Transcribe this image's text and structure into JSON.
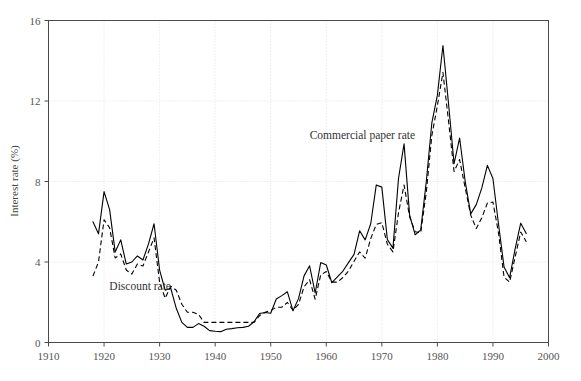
{
  "chart_data": {
    "type": "line",
    "title": "",
    "xlabel": "",
    "ylabel": "Interest rate (%)",
    "xlim": [
      1910,
      2000
    ],
    "ylim": [
      0,
      16
    ],
    "xticks": [
      1910,
      1920,
      1930,
      1940,
      1950,
      1960,
      1970,
      1980,
      1990,
      2000
    ],
    "yticks": [
      0,
      4,
      8,
      12,
      16
    ],
    "grid": true,
    "legend_position": "inline-annotations",
    "annotations": [
      {
        "text": "Commercial paper rate",
        "x": 1966.5,
        "y": 10.1,
        "anchor": "middle"
      },
      {
        "text": "Discount rate",
        "x": 1926.5,
        "y": 2.6,
        "anchor": "middle"
      }
    ],
    "series": [
      {
        "name": "Commercial paper rate",
        "style": "solid",
        "x": [
          1918,
          1919,
          1920,
          1921,
          1922,
          1923,
          1924,
          1925,
          1926,
          1927,
          1928,
          1929,
          1930,
          1931,
          1932,
          1933,
          1934,
          1935,
          1936,
          1937,
          1938,
          1939,
          1940,
          1941,
          1942,
          1943,
          1944,
          1945,
          1946,
          1947,
          1948,
          1949,
          1950,
          1951,
          1952,
          1953,
          1954,
          1955,
          1956,
          1957,
          1958,
          1959,
          1960,
          1961,
          1962,
          1963,
          1964,
          1965,
          1966,
          1967,
          1968,
          1969,
          1970,
          1971,
          1972,
          1973,
          1974,
          1975,
          1976,
          1977,
          1978,
          1979,
          1980,
          1981,
          1982,
          1983,
          1984,
          1985,
          1986,
          1987,
          1988,
          1989,
          1990,
          1991,
          1992,
          1993,
          1994,
          1995,
          1996
        ],
        "values": [
          6.0,
          5.4,
          7.5,
          6.6,
          4.5,
          5.1,
          3.9,
          4.0,
          4.3,
          4.1,
          4.9,
          5.9,
          3.6,
          2.6,
          2.7,
          1.7,
          1.0,
          0.75,
          0.75,
          0.94,
          0.81,
          0.59,
          0.56,
          0.54,
          0.66,
          0.69,
          0.73,
          0.75,
          0.81,
          1.03,
          1.44,
          1.49,
          1.45,
          2.16,
          2.33,
          2.52,
          1.58,
          2.18,
          3.31,
          3.81,
          2.46,
          3.97,
          3.85,
          2.97,
          3.26,
          3.55,
          3.97,
          4.38,
          5.55,
          5.1,
          5.9,
          7.83,
          7.72,
          5.11,
          4.69,
          8.15,
          9.87,
          6.33,
          5.35,
          5.6,
          7.99,
          10.91,
          12.29,
          14.76,
          11.89,
          8.89,
          10.16,
          8.01,
          6.39,
          6.85,
          7.68,
          8.8,
          8.15,
          5.89,
          3.75,
          3.22,
          4.66,
          5.93,
          5.42
        ]
      },
      {
        "name": "Discount rate",
        "style": "dashed",
        "x": [
          1918,
          1919,
          1920,
          1921,
          1922,
          1923,
          1924,
          1925,
          1926,
          1927,
          1928,
          1929,
          1930,
          1931,
          1932,
          1933,
          1934,
          1935,
          1936,
          1937,
          1938,
          1939,
          1940,
          1941,
          1942,
          1943,
          1944,
          1945,
          1946,
          1947,
          1948,
          1949,
          1950,
          1951,
          1952,
          1953,
          1954,
          1955,
          1956,
          1957,
          1958,
          1959,
          1960,
          1961,
          1962,
          1963,
          1964,
          1965,
          1966,
          1967,
          1968,
          1969,
          1970,
          1971,
          1972,
          1973,
          1974,
          1975,
          1976,
          1977,
          1978,
          1979,
          1980,
          1981,
          1982,
          1983,
          1984,
          1985,
          1986,
          1987,
          1988,
          1989,
          1990,
          1991,
          1992,
          1993,
          1994,
          1995,
          1996
        ],
        "values": [
          3.3,
          4.0,
          6.1,
          5.7,
          4.2,
          4.4,
          3.6,
          3.4,
          3.9,
          3.8,
          4.5,
          5.2,
          3.0,
          2.2,
          2.8,
          2.6,
          1.9,
          1.5,
          1.5,
          1.4,
          1.0,
          1.0,
          1.0,
          1.0,
          1.0,
          1.0,
          1.0,
          1.0,
          1.0,
          1.0,
          1.34,
          1.5,
          1.59,
          1.75,
          1.75,
          1.99,
          1.6,
          1.89,
          2.77,
          3.12,
          2.15,
          3.36,
          3.53,
          3.0,
          3.0,
          3.23,
          3.55,
          4.04,
          4.5,
          4.19,
          5.16,
          5.87,
          5.95,
          4.88,
          4.5,
          6.44,
          7.83,
          6.25,
          5.5,
          5.46,
          7.46,
          10.28,
          11.77,
          13.42,
          11.02,
          8.5,
          9.09,
          7.69,
          6.33,
          5.66,
          6.2,
          6.93,
          6.98,
          5.45,
          3.25,
          3.0,
          4.25,
          5.49,
          5.01
        ]
      }
    ]
  },
  "axes": {
    "y_title": "Interest rate (%)",
    "x_tick_labels": [
      "1910",
      "1920",
      "1930",
      "1940",
      "1950",
      "1960",
      "1970",
      "1980",
      "1990",
      "2000"
    ],
    "y_tick_labels": [
      "0",
      "4",
      "8",
      "12",
      "16"
    ]
  },
  "colors": {
    "line": "#000000",
    "frame": "#4a4a4a",
    "grid": "#d9d9d9",
    "text": "#555555",
    "background": "#ffffff"
  }
}
